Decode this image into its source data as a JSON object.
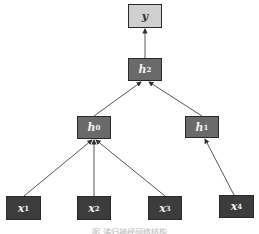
{
  "diagram": {
    "nodes": [
      {
        "id": "y",
        "label": "y",
        "sub": "",
        "shade": "light"
      },
      {
        "id": "h2",
        "label": "h",
        "sub": "2",
        "shade": "mid"
      },
      {
        "id": "h0",
        "label": "h",
        "sub": "0",
        "shade": "mid"
      },
      {
        "id": "h1",
        "label": "h",
        "sub": "1",
        "shade": "mid"
      },
      {
        "id": "x1",
        "label": "x",
        "sub": "1",
        "shade": "dark"
      },
      {
        "id": "x2",
        "label": "x",
        "sub": "2",
        "shade": "dark"
      },
      {
        "id": "x3",
        "label": "x",
        "sub": "3",
        "shade": "dark"
      },
      {
        "id": "x4",
        "label": "x",
        "sub": "4",
        "shade": "dark"
      }
    ],
    "edges": [
      {
        "from": "h2",
        "to": "y"
      },
      {
        "from": "h0",
        "to": "h2"
      },
      {
        "from": "h1",
        "to": "h2"
      },
      {
        "from": "x1",
        "to": "h0"
      },
      {
        "from": "x2",
        "to": "h0"
      },
      {
        "from": "x3",
        "to": "h0"
      },
      {
        "from": "x4",
        "to": "h1"
      }
    ],
    "caption": "图 递归神经网络结构"
  }
}
